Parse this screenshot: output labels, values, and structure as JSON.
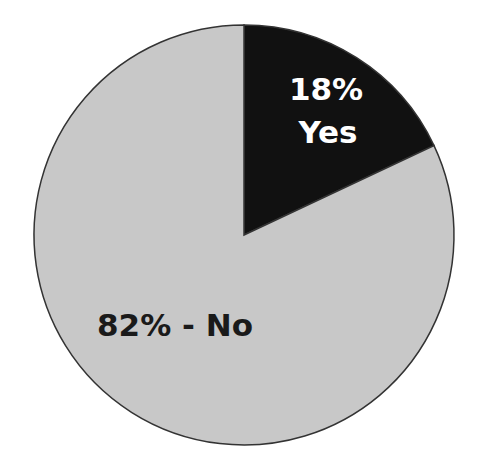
{
  "chart_data": {
    "type": "pie",
    "title": "",
    "categories": [
      "Yes",
      "No"
    ],
    "values": [
      18,
      82
    ],
    "labels": [
      "18%",
      "Yes",
      "82% - No"
    ],
    "colors": {
      "Yes": "#111111",
      "No": "#c8c8c8"
    },
    "start_angle_deg": 0,
    "direction": "clockwise",
    "legend": "none"
  },
  "labels": {
    "yes_pct": "18%",
    "yes_name": "Yes",
    "no_label": "82% - No"
  },
  "style": {
    "outline": "#333333",
    "yes_text_color": "#ffffff",
    "no_text_color": "#1a1a1a"
  }
}
